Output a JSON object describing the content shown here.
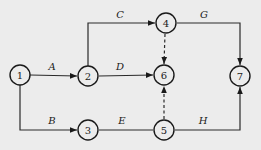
{
  "diagram": {
    "type": "activity-on-arrow network",
    "colors": {
      "background": "#ececec",
      "stroke": "#1a1a1a"
    },
    "nodes": [
      {
        "id": "1",
        "label": "1",
        "x": 20,
        "y": 75
      },
      {
        "id": "2",
        "label": "2",
        "x": 88,
        "y": 76
      },
      {
        "id": "3",
        "label": "3",
        "x": 88,
        "y": 130
      },
      {
        "id": "4",
        "label": "4",
        "x": 166,
        "y": 23
      },
      {
        "id": "5",
        "label": "5",
        "x": 164,
        "y": 130
      },
      {
        "id": "6",
        "label": "6",
        "x": 164,
        "y": 75
      },
      {
        "id": "7",
        "label": "7",
        "x": 240,
        "y": 76
      }
    ],
    "edges": [
      {
        "from": "1",
        "to": "2",
        "label": "A",
        "style": "solid"
      },
      {
        "from": "1",
        "to": "3",
        "label": "B",
        "style": "solid"
      },
      {
        "from": "2",
        "to": "4",
        "label": "C",
        "style": "solid"
      },
      {
        "from": "2",
        "to": "6",
        "label": "D",
        "style": "solid"
      },
      {
        "from": "3",
        "to": "5",
        "label": "E",
        "style": "solid"
      },
      {
        "from": "4",
        "to": "7",
        "label": "G",
        "style": "solid"
      },
      {
        "from": "5",
        "to": "7",
        "label": "H",
        "style": "solid"
      },
      {
        "from": "4",
        "to": "6",
        "label": "",
        "style": "dashed"
      },
      {
        "from": "5",
        "to": "6",
        "label": "",
        "style": "dashed"
      }
    ]
  }
}
